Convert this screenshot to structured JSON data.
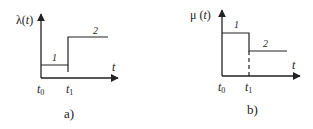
{
  "diagram": {
    "panels": [
      {
        "id": "a",
        "caption": "a)",
        "y_axis_label": "λ(t)",
        "x_axis_label": "t",
        "x_ticks": [
          "t0",
          "t1"
        ],
        "segments": [
          {
            "label": "1",
            "description": "low constant level from t0 to t1"
          },
          {
            "label": "2",
            "description": "high constant level after t1"
          }
        ]
      },
      {
        "id": "b",
        "caption": "b)",
        "y_axis_label": "μ (t)",
        "x_axis_label": "t",
        "x_ticks": [
          "t0",
          "t1"
        ],
        "segments": [
          {
            "label": "1",
            "description": "high constant level from t0 to t1"
          },
          {
            "label": "2",
            "description": "lower constant level after t1"
          }
        ]
      }
    ]
  },
  "colors": {
    "line": "#222222",
    "background": "#ffffff"
  }
}
